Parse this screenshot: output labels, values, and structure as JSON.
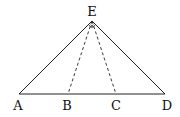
{
  "diagram": {
    "type": "geometry",
    "colors": {
      "line": "#222222",
      "background": "#ffffff"
    },
    "points": {
      "A": {
        "label": "A",
        "x": 19,
        "y": 94
      },
      "B": {
        "label": "B",
        "x": 68,
        "y": 94
      },
      "C": {
        "label": "C",
        "x": 116,
        "y": 94
      },
      "D": {
        "label": "D",
        "x": 165,
        "y": 94
      },
      "E": {
        "label": "E",
        "x": 92,
        "y": 21
      }
    },
    "segments": [
      {
        "from": "A",
        "to": "D",
        "style": "solid"
      },
      {
        "from": "A",
        "to": "E",
        "style": "solid"
      },
      {
        "from": "E",
        "to": "D",
        "style": "solid"
      },
      {
        "from": "E",
        "to": "B",
        "style": "dashed"
      },
      {
        "from": "E",
        "to": "C",
        "style": "dashed"
      }
    ],
    "right_angle_markers": [
      {
        "vertex": "E",
        "between": [
          "A",
          "C"
        ]
      },
      {
        "vertex": "E",
        "between": [
          "B",
          "D"
        ]
      }
    ]
  }
}
